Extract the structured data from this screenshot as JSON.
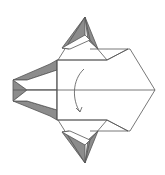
{
  "diagram": {
    "type": "origami-fold-step",
    "title": "",
    "colors": {
      "paper_front": "#ffffff",
      "paper_back": "#8c8c8c",
      "line": "#555555",
      "arrow": "#666666"
    },
    "annotations": [
      {
        "kind": "fold-arrow",
        "direction": "curved-down",
        "description": "fold in half along center line"
      }
    ],
    "elements": {
      "center_crease": "horizontal center line",
      "top_point": "upper pointed flap",
      "bottom_point": "lower pointed flap",
      "left_flaps": "shaded left wing flaps",
      "right_point": "right arrow-shaped end"
    }
  }
}
